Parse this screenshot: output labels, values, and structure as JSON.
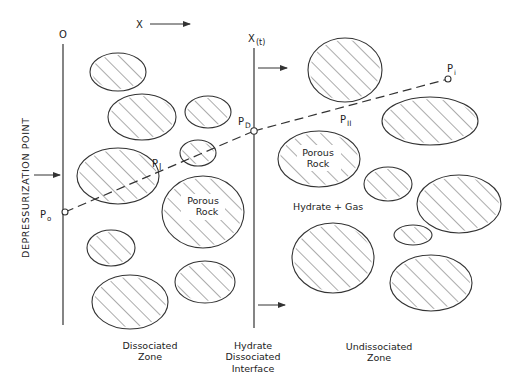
{
  "diagram": {
    "axis_labels": {
      "origin": "O",
      "x_direction": "X",
      "interface": "X",
      "interface_sub": "(t)"
    },
    "side_label": "DEPRESSURIZATION  POINT",
    "pressure_points": {
      "p0": {
        "main": "P",
        "sub": "o"
      },
      "pI": {
        "main": "P",
        "sub": "I"
      },
      "pD": {
        "main": "P",
        "sub": "D"
      },
      "pII": {
        "main": "P",
        "sub": "II"
      },
      "pi": {
        "main": "P",
        "sub": "i"
      }
    },
    "region_labels": {
      "porous_rock_left": [
        "Porous",
        "Rock"
      ],
      "porous_rock_right": [
        "Porous",
        "Rock"
      ],
      "hydrate_gas": "Hydrate + Gas"
    },
    "zone_captions": {
      "dissociated": [
        "Dissociated",
        "Zone"
      ],
      "interface": [
        "Hydrate",
        "Dissociated",
        "Interface"
      ],
      "undissociated": [
        "Undissociated",
        "Zone"
      ]
    },
    "colors": {
      "line": "#333333",
      "background": "#ffffff"
    }
  }
}
